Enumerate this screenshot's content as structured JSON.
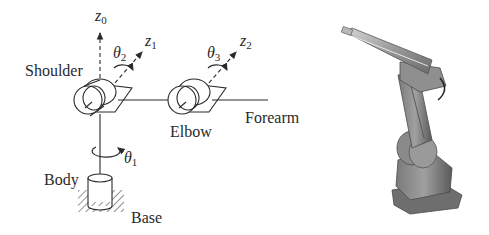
{
  "figure": {
    "schematic": {
      "labels": {
        "shoulder": "Shoulder",
        "elbow": "Elbow",
        "forearm": "Forearm",
        "body": "Body",
        "base": "Base"
      },
      "axes": [
        {
          "symbol": "z",
          "subscript": "0"
        },
        {
          "symbol": "z",
          "subscript": "1"
        },
        {
          "symbol": "z",
          "subscript": "2"
        }
      ],
      "joint_angles": [
        {
          "symbol": "θ",
          "subscript": "1"
        },
        {
          "symbol": "θ",
          "subscript": "2"
        },
        {
          "symbol": "θ",
          "subscript": "3"
        }
      ]
    },
    "photo": {
      "subject": "industrial-robot-arm-photo"
    },
    "colors": {
      "line": "#2a2a2a",
      "photo_body": "#8a8a8a",
      "photo_dark": "#4a4a4a",
      "photo_light": "#c8c8c8"
    }
  }
}
